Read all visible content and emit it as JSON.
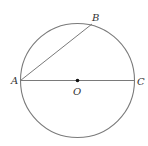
{
  "diagram": {
    "type": "geometry",
    "stroke_color": "#7a7a7a",
    "point_color": "#111111",
    "circle": {
      "center": "O",
      "cx": 77.5,
      "cy": 80.5,
      "r": 57
    },
    "points": {
      "A": {
        "label": "A",
        "x": 20.5,
        "y": 80.5
      },
      "B": {
        "label": "B",
        "x": 92,
        "y": 24
      },
      "C": {
        "label": "C",
        "x": 134.5,
        "y": 80.5
      },
      "O": {
        "label": "O",
        "x": 77.5,
        "y": 80.5
      }
    },
    "segments": [
      {
        "from": "A",
        "to": "C",
        "name": "diameter"
      },
      {
        "from": "A",
        "to": "B",
        "name": "chord"
      }
    ]
  }
}
